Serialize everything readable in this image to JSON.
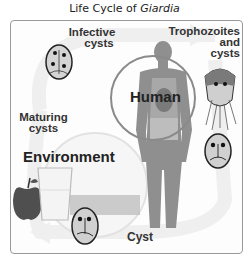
{
  "title": {
    "prefix": "Life Cycle of ",
    "organism": "Giardia"
  },
  "labels": {
    "infective_cysts": [
      "Infective",
      "cysts"
    ],
    "trophozoites": [
      "Trophozoites",
      "and",
      "cysts"
    ],
    "maturing_cysts": [
      "Maturing",
      "cysts"
    ],
    "human": "Human",
    "environment": "Environment",
    "cyst": "Cyst"
  },
  "stages": [
    "Infective cysts",
    "Trophozoites and cysts",
    "Cyst",
    "Maturing cysts"
  ],
  "hosts": [
    "Human",
    "Environment"
  ],
  "colors": {
    "frame": "#9a9a9a",
    "arrow": "#ececec",
    "circle": "#8a8a8a",
    "body": "#8f8f8f",
    "text": "#333333"
  }
}
